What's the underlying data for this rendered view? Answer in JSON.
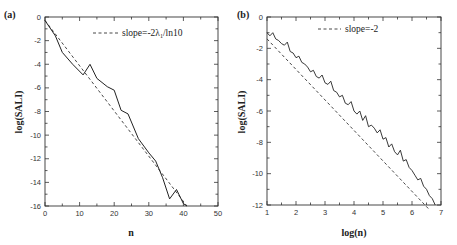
{
  "chart_data": [
    {
      "type": "line",
      "panel_label": "(a)",
      "title": "",
      "xlabel": "n",
      "ylabel": "log(SALI)",
      "xlim": [
        0,
        50
      ],
      "ylim": [
        -16,
        0
      ],
      "xticks": [
        "0",
        "10",
        "20",
        "30",
        "40",
        "50"
      ],
      "yticks": [
        "0",
        "-2",
        "-4",
        "-6",
        "-8",
        "-10",
        "-12",
        "-14",
        "-16"
      ],
      "grid": false,
      "legend": {
        "position": "top-right",
        "entries": [
          "slope=-2λ1/ln10"
        ]
      },
      "legend_text": "slope=-2λ",
      "legend_sub": "1",
      "legend_suffix": "/ln10",
      "series": [
        {
          "name": "log(SALI)",
          "style": "solid",
          "x": [
            0,
            3,
            5,
            8,
            11,
            13,
            15,
            18,
            20,
            22,
            24,
            27,
            30,
            32,
            34,
            36,
            38,
            40,
            41
          ],
          "y": [
            -0.3,
            -1.6,
            -3.0,
            -4.0,
            -4.9,
            -4.0,
            -5.2,
            -5.9,
            -6.2,
            -7.9,
            -8.2,
            -10.3,
            -11.5,
            -12.2,
            -13.6,
            -15.4,
            -14.6,
            -15.8,
            -16.0
          ]
        },
        {
          "name": "slope=-2λ1/ln10",
          "style": "dashed",
          "x": [
            0,
            41
          ],
          "y": [
            -0.3,
            -16.0
          ]
        }
      ]
    },
    {
      "type": "line",
      "panel_label": "(b)",
      "title": "",
      "xlabel": "log(n)",
      "ylabel": "log(SALI)",
      "xlim": [
        1,
        7
      ],
      "ylim": [
        -12,
        0
      ],
      "xticks": [
        "1",
        "2",
        "3",
        "4",
        "5",
        "6",
        "7"
      ],
      "yticks": [
        "0",
        "-2",
        "-4",
        "-6",
        "-8",
        "-10",
        "-12"
      ],
      "grid": false,
      "legend": {
        "position": "top-center",
        "entries": [
          "slope=-2"
        ]
      },
      "legend_text": "slope=-2",
      "series": [
        {
          "name": "log(SALI)",
          "style": "solid-noisy",
          "x": [
            1.0,
            1.1,
            1.2,
            1.3,
            1.4,
            1.5,
            1.6,
            1.7,
            1.8,
            1.9,
            2.0,
            2.1,
            2.2,
            2.3,
            2.4,
            2.5,
            2.6,
            2.7,
            2.8,
            2.9,
            3.0,
            3.1,
            3.2,
            3.3,
            3.4,
            3.5,
            3.6,
            3.7,
            3.8,
            3.9,
            4.0,
            4.1,
            4.2,
            4.3,
            4.4,
            4.5,
            4.6,
            4.7,
            4.8,
            4.9,
            5.0,
            5.1,
            5.2,
            5.3,
            5.4,
            5.5,
            5.6,
            5.7,
            5.8,
            5.9,
            6.0,
            6.1,
            6.2,
            6.3,
            6.4,
            6.5,
            6.6,
            6.7,
            6.8
          ],
          "y": [
            -1.0,
            -1.2,
            -1.0,
            -1.4,
            -1.5,
            -1.7,
            -1.8,
            -1.6,
            -2.2,
            -2.3,
            -2.6,
            -2.5,
            -2.9,
            -3.0,
            -3.2,
            -3.5,
            -3.4,
            -3.8,
            -3.9,
            -3.7,
            -4.2,
            -4.3,
            -4.1,
            -4.7,
            -4.8,
            -5.1,
            -5.0,
            -5.5,
            -5.6,
            -5.4,
            -6.0,
            -6.2,
            -6.0,
            -6.6,
            -6.3,
            -7.0,
            -6.9,
            -7.1,
            -7.4,
            -7.2,
            -7.8,
            -7.7,
            -8.3,
            -8.1,
            -8.6,
            -8.8,
            -8.5,
            -9.2,
            -9.1,
            -9.6,
            -9.8,
            -10.1,
            -10.4,
            -10.3,
            -10.8,
            -11.0,
            -11.4,
            -11.6,
            -12.0
          ]
        },
        {
          "name": "slope=-2",
          "style": "dashed",
          "x": [
            1.0,
            6.6
          ],
          "y": [
            -1.4,
            -12.3
          ]
        }
      ]
    }
  ]
}
